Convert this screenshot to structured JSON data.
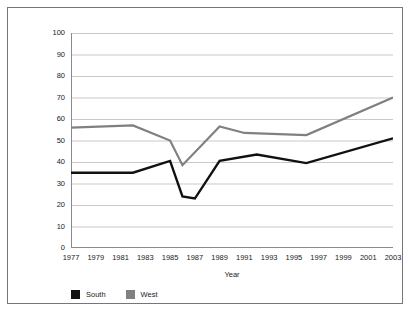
{
  "figure": {
    "border_color": "#76767a",
    "background": "#ffffff"
  },
  "legend": {
    "position": "bottom-left",
    "items": [
      {
        "label": "South",
        "color": "#111111",
        "swatch": "legend-swatch-south"
      },
      {
        "label": "West",
        "color": "#808080",
        "swatch": "legend-swatch-west"
      }
    ]
  },
  "chart_data": {
    "type": "line",
    "title": "",
    "xlabel": "Year",
    "ylabel": "Percentage in Agreement",
    "ylim": [
      0,
      100
    ],
    "yticks": [
      0,
      10,
      20,
      30,
      40,
      50,
      60,
      70,
      80,
      90,
      100
    ],
    "ytick_labels": [
      "0",
      "10",
      "20",
      "30",
      "40",
      "50",
      "60",
      "70",
      "80",
      "90",
      "100"
    ],
    "xlim": [
      1977,
      2003
    ],
    "xticks": [
      1977,
      1979,
      1981,
      1983,
      1985,
      1987,
      1989,
      1991,
      1993,
      1995,
      1997,
      1999,
      2001,
      2003
    ],
    "xtick_labels": [
      "1977",
      "1979",
      "1981",
      "1983",
      "1985",
      "1987",
      "1989",
      "1991",
      "1993",
      "1995",
      "1997",
      "1999",
      "2001",
      "2003"
    ],
    "grid": "horizontal",
    "grid_color": "#c9c9c9",
    "legend_position": "bottom-left",
    "x": [
      1977,
      1982,
      1985,
      1986,
      1987,
      1989,
      1992,
      1996,
      2003
    ],
    "series": [
      {
        "name": "South",
        "color": "#111111",
        "line_width": 2.4,
        "x": [
          1977,
          1982,
          1985,
          1986,
          1987,
          1989,
          1992,
          1996,
          2003
        ],
        "values": [
          35,
          35,
          40.5,
          24,
          23,
          40.5,
          43.5,
          39.5,
          51
        ]
      },
      {
        "name": "West",
        "color": "#808080",
        "line_width": 2.2,
        "x": [
          1977,
          1982,
          1985,
          1986,
          1989,
          1991,
          1996,
          2003
        ],
        "values": [
          56,
          57,
          50,
          38.5,
          56.5,
          53.5,
          52.5,
          70
        ]
      }
    ]
  }
}
